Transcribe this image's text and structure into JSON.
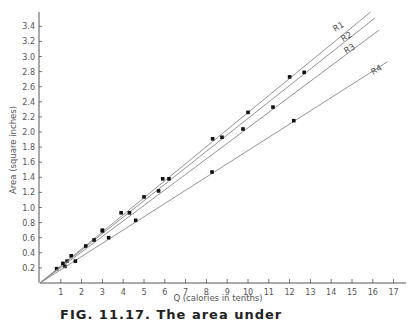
{
  "chart_data": {
    "type": "scatter",
    "title": "",
    "xlabel": "Q (calories in tenths)",
    "ylabel": "Area (square inches)",
    "xlim": [
      0,
      17
    ],
    "ylim": [
      0,
      3.5
    ],
    "x_ticks": [
      1,
      2,
      3,
      4,
      5,
      6,
      7,
      8,
      9,
      10,
      11,
      12,
      13,
      14,
      15,
      16,
      17
    ],
    "y_ticks": [
      "0.2",
      "0.4",
      "0.6",
      "0.8",
      "1.0",
      "1.2",
      "1.4",
      "1.6",
      "1.8",
      "2.0",
      "2.2",
      "2.4",
      "2.6",
      "2.8",
      "3.0",
      "3.2",
      "3.4"
    ],
    "grid": false,
    "legend": "inline line labels at upper right",
    "series": [
      {
        "name": "R1",
        "line": {
          "x": [
            0,
            15.9
          ],
          "y": [
            0,
            3.59
          ]
        },
        "points": {
          "x": [
            0.8,
            1.3,
            1.5,
            3.0,
            3.9,
            5.9,
            8.3,
            12.0
          ],
          "y": [
            0.19,
            0.29,
            0.36,
            0.7,
            0.93,
            1.38,
            1.91,
            2.73
          ]
        }
      },
      {
        "name": "R2",
        "line": {
          "x": [
            0,
            16.1
          ],
          "y": [
            0,
            3.51
          ]
        },
        "points": {
          "x": [
            1.1,
            2.2,
            3.0,
            5.0,
            6.2,
            8.75,
            10.0,
            12.7
          ],
          "y": [
            0.26,
            0.49,
            0.69,
            1.14,
            1.38,
            1.93,
            2.26,
            2.79
          ]
        }
      },
      {
        "name": "R3",
        "line": {
          "x": [
            0,
            16.3
          ],
          "y": [
            0,
            3.35
          ]
        },
        "points": {
          "x": [
            1.2,
            2.6,
            4.3,
            5.7,
            9.76,
            11.2
          ],
          "y": [
            0.22,
            0.57,
            0.93,
            1.22,
            2.04,
            2.33
          ]
        }
      },
      {
        "name": "R4",
        "line": {
          "x": [
            0,
            16.7
          ],
          "y": [
            0,
            2.93
          ]
        },
        "points": {
          "x": [
            1.7,
            3.3,
            4.6,
            8.27,
            12.2
          ],
          "y": [
            0.29,
            0.6,
            0.83,
            1.47,
            2.15
          ]
        }
      }
    ]
  },
  "labels": {
    "xlabel": "Q (calories in tenths)",
    "ylabel": "Area (square inches)",
    "caption": "FIG. 11.17. The area under"
  }
}
